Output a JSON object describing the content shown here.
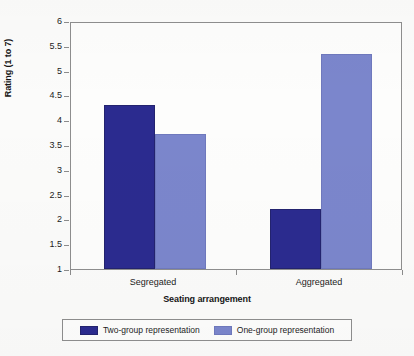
{
  "chart_data": {
    "type": "bar",
    "title": "",
    "subtitle": "",
    "xlabel": "Seating arrangement",
    "ylabel": "Rating (1 to 7)",
    "categories": [
      "Segregated",
      "Aggregated"
    ],
    "series": [
      {
        "name": "Two-group representation",
        "values": [
          4.3,
          2.2
        ],
        "color": "#2b2b8f"
      },
      {
        "name": "One-group representation",
        "values": [
          3.73,
          5.33
        ],
        "color": "#7b86cc"
      }
    ],
    "ylim": [
      1,
      6
    ],
    "ytick_labels": [
      "6",
      "5.5",
      "5",
      "4.5",
      "4",
      "3.5",
      "3",
      "2.5",
      "2",
      "1.5",
      "1"
    ],
    "ytick_values": [
      6,
      5.5,
      5,
      4.5,
      4,
      3.5,
      3,
      2.5,
      2,
      1.5,
      1
    ],
    "grid": false,
    "legend_position": "bottom",
    "legend_entries": [
      "Two-group representation",
      "One-group representation"
    ],
    "annotations": []
  },
  "axes": {
    "y_title": "Rating (1 to 7)",
    "x_title": "Seating arrangement"
  },
  "legend": {
    "items": [
      {
        "label": "Two-group representation",
        "swatch": "dark-blue-swatch"
      },
      {
        "label": "One-group representation",
        "swatch": "light-blue-swatch"
      }
    ]
  }
}
